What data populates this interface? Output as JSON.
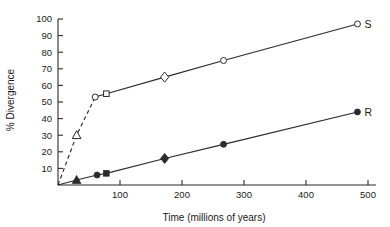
{
  "chart_data": {
    "type": "line",
    "title": "",
    "xlabel": "Time (millions of years)",
    "ylabel": "% Divergence",
    "xlim": [
      0,
      500
    ],
    "ylim": [
      0,
      100
    ],
    "grid": false,
    "legend_position": "right-of-line-end",
    "xticks": [
      100,
      200,
      300,
      400,
      500
    ],
    "xticklabels": [
      "100",
      "200",
      "300",
      "400",
      "500"
    ],
    "yticks": [
      10,
      20,
      30,
      40,
      50,
      60,
      70,
      80,
      90,
      100
    ],
    "yticklabels": [
      "10",
      "20",
      "30",
      "40",
      "50",
      "60",
      "70",
      "80",
      "90",
      "100"
    ],
    "series": [
      {
        "name": "S",
        "label": "S",
        "marker_style": "open",
        "points": [
          {
            "x": 0,
            "y": 0,
            "marker": "none",
            "segment": "dashed"
          },
          {
            "x": 30,
            "y": 30,
            "marker": "triangle",
            "segment": "dashed"
          },
          {
            "x": 60,
            "y": 53,
            "marker": "circle",
            "segment": "dashed"
          },
          {
            "x": 78,
            "y": 55,
            "marker": "square",
            "segment": "solid"
          },
          {
            "x": 172,
            "y": 65,
            "marker": "diamond",
            "segment": "solid"
          },
          {
            "x": 267,
            "y": 75,
            "marker": "circle",
            "segment": "solid"
          },
          {
            "x": 483,
            "y": 97,
            "marker": "circle",
            "segment": "solid"
          }
        ]
      },
      {
        "name": "R",
        "label": "R",
        "marker_style": "filled",
        "points": [
          {
            "x": 0,
            "y": 0,
            "marker": "none",
            "segment": "solid"
          },
          {
            "x": 30,
            "y": 3,
            "marker": "triangle",
            "segment": "solid"
          },
          {
            "x": 63,
            "y": 6,
            "marker": "circle",
            "segment": "solid"
          },
          {
            "x": 78,
            "y": 7,
            "marker": "square",
            "segment": "solid"
          },
          {
            "x": 172,
            "y": 16,
            "marker": "diamond",
            "segment": "solid"
          },
          {
            "x": 267,
            "y": 24.5,
            "marker": "circle",
            "segment": "solid"
          },
          {
            "x": 483,
            "y": 44,
            "marker": "circle",
            "segment": "solid"
          }
        ]
      }
    ],
    "colors": {
      "line": "#2b2b2b",
      "marker_fill_open": "#ffffff",
      "marker_fill_closed": "#2b2b2b",
      "axis": "#2b2b2b",
      "text": "#1a1a1a",
      "background": "#ffffff"
    }
  }
}
